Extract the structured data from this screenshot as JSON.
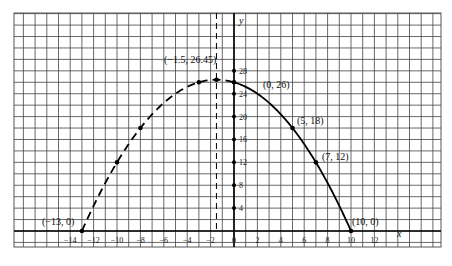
{
  "chart_data": {
    "type": "line",
    "title": "",
    "xlabel": "x",
    "ylabel": "y",
    "equation_implied": "y = -0.2x^2 - 0.6x + 26",
    "xlim": [
      -18,
      18.5
    ],
    "ylim": [
      -2.8,
      38
    ],
    "grid": true,
    "x_ticks": [
      -14,
      -12,
      -10,
      -8,
      -6,
      -4,
      -2,
      0,
      2,
      4,
      6,
      8,
      10,
      12
    ],
    "x_tick_labels": [
      "−14",
      "−12",
      "−10",
      "−8",
      "−6",
      "−4",
      "−2",
      "0",
      "2",
      "4",
      "6",
      "8",
      "10",
      "12"
    ],
    "y_ticks": [
      4,
      8,
      12,
      16,
      20,
      24,
      28
    ],
    "y_tick_labels": [
      "4",
      "8",
      "12",
      "16",
      "20",
      "24",
      "28"
    ],
    "series": [
      {
        "name": "dashed-branch",
        "style": "dashed",
        "x": [
          -13,
          -12,
          -10,
          -8,
          -6,
          -4,
          -3,
          -2,
          -1.5,
          0
        ],
        "y": [
          0,
          7.4,
          12,
          18,
          22.4,
          25.2,
          26,
          26.4,
          26.45,
          26
        ]
      },
      {
        "name": "solid-branch",
        "style": "solid",
        "x": [
          0,
          1,
          2,
          3,
          4,
          5,
          6,
          7,
          8,
          9,
          10
        ],
        "y": [
          26,
          25.2,
          24,
          22.4,
          20.4,
          18,
          15.2,
          12,
          8.4,
          4.4,
          0
        ]
      }
    ],
    "points": [
      {
        "x": -13,
        "y": 0,
        "label": "(−13, 0)"
      },
      {
        "x": -1.5,
        "y": 26.45,
        "label": "(−1.5, 26.45)"
      },
      {
        "x": 0,
        "y": 26,
        "label": "(0, 26)"
      },
      {
        "x": 5,
        "y": 18,
        "label": "(5, 18)"
      },
      {
        "x": 7,
        "y": 12,
        "label": "(7, 12)"
      },
      {
        "x": 10,
        "y": 0,
        "label": "(10, 0)"
      }
    ],
    "unlabeled_points": [
      {
        "x": -10,
        "y": 12
      },
      {
        "x": -8,
        "y": 18
      },
      {
        "x": -3,
        "y": 26
      }
    ],
    "vertical_dashed_line": {
      "x": -1.5,
      "label": "axis of symmetry"
    }
  },
  "labels": {
    "x_axis": "x",
    "y_axis": "y",
    "p_neg13": "(−13, 0)",
    "p_vertex": "(−1.5, 26.45)",
    "p_0_26": "(0, 26)",
    "p_5_18": "(5, 18)",
    "p_7_12": "(7, 12)",
    "p_10_0": "(10, 0)"
  }
}
